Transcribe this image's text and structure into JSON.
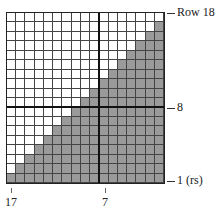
{
  "chart": {
    "columns": 17,
    "rows": 18,
    "shaded_color": "#9a9a9a",
    "empty_color": "#ffffff",
    "line_color": "#444444",
    "heavy_col_after_index": 10,
    "heavy_row_after_index": 10
  },
  "labels": {
    "row_top": "Row 18",
    "row_mid": "8",
    "row_bottom": "1 (rs)",
    "col_left": "17",
    "col_mid": "7"
  },
  "chart_data": {
    "type": "heatmap",
    "title": "",
    "xlabel": "Stitch",
    "ylabel": "Row",
    "x_labels": [
      "17",
      "7"
    ],
    "y_labels": [
      "Row 18",
      "8",
      "1 (rs)"
    ],
    "shaded_per_row_from_top": [
      0,
      1,
      2,
      3,
      4,
      5,
      6,
      7,
      8,
      9,
      10,
      11,
      12,
      13,
      14,
      15,
      16,
      17
    ]
  }
}
